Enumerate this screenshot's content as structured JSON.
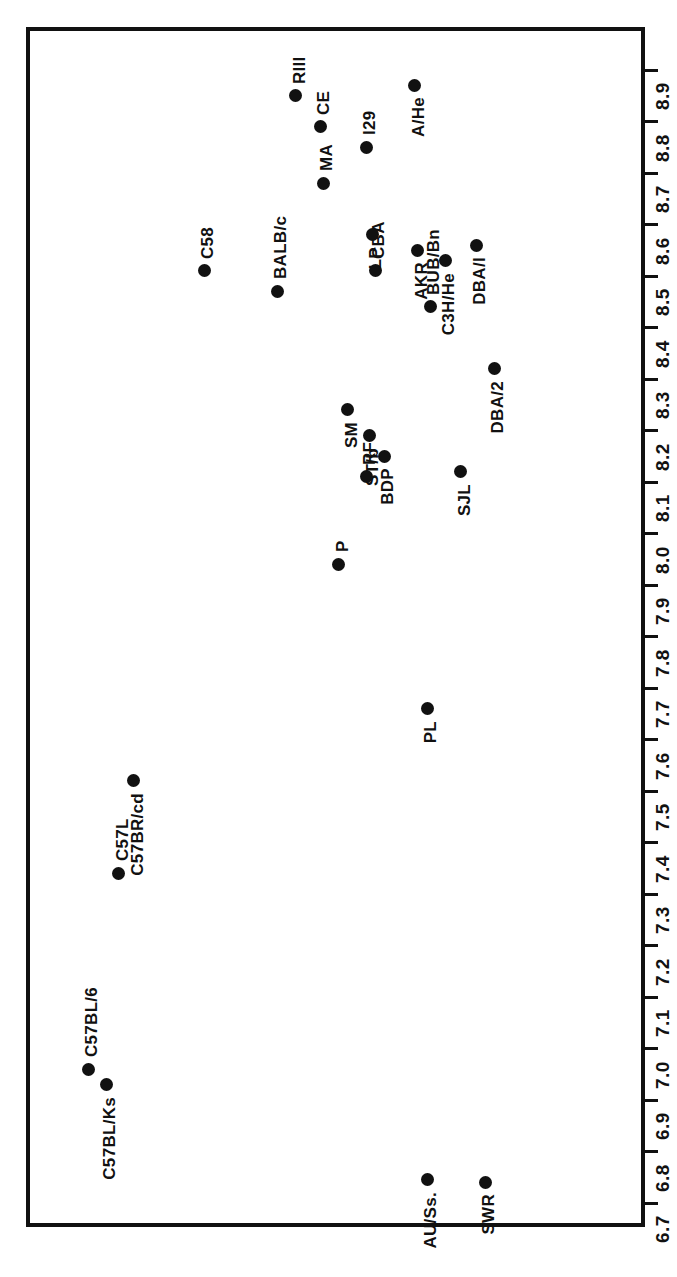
{
  "figure": {
    "orientation": "rotated-90",
    "frame_color": "#111111",
    "point_color": "#111111"
  },
  "chart_data": {
    "type": "scatter",
    "title": "",
    "subtitle": "",
    "xlabel": "",
    "ylabel": "",
    "grid": false,
    "legend": "none",
    "orientation": "horizontal-value-axis-rotated",
    "axis": {
      "name": "value-axis",
      "min": 6.7,
      "max": 8.9,
      "tick_step": 0.1,
      "tick_labels": [
        "6.7",
        "6.8",
        "6.9",
        "7.0",
        "7.1",
        "7.2",
        "7.3",
        "7.4",
        "7.5",
        "7.6",
        "7.7",
        "7.8",
        "7.9",
        "8.0",
        "8.1",
        "8.2",
        "8.3",
        "8.4",
        "8.5",
        "8.6",
        "8.7",
        "8.8",
        "8.9"
      ]
    },
    "categories": [
      "A/He",
      "RIII",
      "CE",
      "I29",
      "MA",
      "LP",
      "C3H/He",
      "DBA/I",
      "AKR",
      "CBA",
      "C58",
      "BALB/c",
      "BUB/Bn",
      "DBA/2",
      "SM",
      "ST/b",
      "BDP",
      "RF",
      "SJL",
      "P",
      "PL",
      "C57BR/cd",
      "C57L",
      "C57BL/6",
      "C57BL/Ks",
      "AU/Ss.",
      "SWR"
    ],
    "values": [
      8.87,
      8.85,
      8.79,
      8.75,
      8.68,
      8.58,
      8.53,
      8.56,
      8.55,
      8.51,
      8.51,
      8.47,
      8.44,
      8.32,
      8.24,
      8.19,
      8.15,
      8.11,
      8.12,
      7.94,
      7.66,
      7.52,
      7.34,
      6.96,
      6.93,
      6.74,
      6.74
    ],
    "points": [
      {
        "label": "A/He",
        "value": 8.87,
        "x_pos": 63.0,
        "label_side": "after"
      },
      {
        "label": "RIII",
        "value": 8.85,
        "x_pos": 43.5,
        "label_side": "before"
      },
      {
        "label": "CE",
        "value": 8.79,
        "x_pos": 47.5,
        "label_side": "before"
      },
      {
        "label": "I29",
        "value": 8.75,
        "x_pos": 55.0,
        "label_side": "before"
      },
      {
        "label": "MA",
        "value": 8.68,
        "x_pos": 48.0,
        "label_side": "before"
      },
      {
        "label": "LP",
        "value": 8.58,
        "x_pos": 56.0,
        "label_side": "after"
      },
      {
        "label": "DBA/I",
        "value": 8.56,
        "x_pos": 73.0,
        "label_side": "after"
      },
      {
        "label": "AKR",
        "value": 8.55,
        "x_pos": 63.5,
        "label_side": "after"
      },
      {
        "label": "C3H/He",
        "value": 8.53,
        "x_pos": 68.0,
        "label_side": "after"
      },
      {
        "label": "CBA",
        "value": 8.51,
        "x_pos": 56.5,
        "label_side": "before"
      },
      {
        "label": "C58",
        "value": 8.51,
        "x_pos": 28.5,
        "label_side": "before"
      },
      {
        "label": "BALB/c",
        "value": 8.47,
        "x_pos": 40.5,
        "label_side": "before"
      },
      {
        "label": "BUB/Bn",
        "value": 8.44,
        "x_pos": 65.5,
        "label_side": "before"
      },
      {
        "label": "DBA/2",
        "value": 8.32,
        "x_pos": 76.0,
        "label_side": "after"
      },
      {
        "label": "SM",
        "value": 8.24,
        "x_pos": 52.0,
        "label_side": "after"
      },
      {
        "label": "ST/b",
        "value": 8.19,
        "x_pos": 55.5,
        "label_side": "after"
      },
      {
        "label": "BDP",
        "value": 8.15,
        "x_pos": 58.0,
        "label_side": "after"
      },
      {
        "label": "RF",
        "value": 8.11,
        "x_pos": 55.0,
        "label_side": "before"
      },
      {
        "label": "SJL",
        "value": 8.12,
        "x_pos": 70.5,
        "label_side": "after"
      },
      {
        "label": "P",
        "value": 7.94,
        "x_pos": 50.5,
        "label_side": "before"
      },
      {
        "label": "PL",
        "value": 7.66,
        "x_pos": 65.0,
        "label_side": "after"
      },
      {
        "label": "C57BR/cd",
        "value": 7.52,
        "x_pos": 17.0,
        "label_side": "after"
      },
      {
        "label": "C57L",
        "value": 7.34,
        "x_pos": 14.5,
        "label_side": "before"
      },
      {
        "label": "C57BL/6",
        "value": 6.96,
        "x_pos": 9.5,
        "label_side": "before"
      },
      {
        "label": "C57BL/Ks",
        "value": 6.93,
        "x_pos": 12.5,
        "label_side": "after"
      },
      {
        "label": "AU/Ss.",
        "value": 6.745,
        "x_pos": 65.0,
        "label_side": "after"
      },
      {
        "label": "SWR",
        "value": 6.74,
        "x_pos": 74.5,
        "label_side": "after"
      }
    ]
  }
}
